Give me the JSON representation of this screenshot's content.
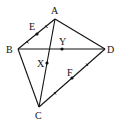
{
  "diagram": {
    "vertices": [
      {
        "id": "A",
        "label": "A",
        "x": 55,
        "y": 19,
        "lx": 51,
        "ly": 14
      },
      {
        "id": "B",
        "label": "B",
        "x": 18,
        "y": 49,
        "lx": 6,
        "ly": 53
      },
      {
        "id": "C",
        "label": "C",
        "x": 39,
        "y": 107,
        "lx": 35,
        "ly": 119
      },
      {
        "id": "D",
        "label": "D",
        "x": 105,
        "y": 49,
        "lx": 107,
        "ly": 53
      }
    ],
    "edges": [
      {
        "from": "A",
        "to": "B"
      },
      {
        "from": "A",
        "to": "D"
      },
      {
        "from": "B",
        "to": "D"
      },
      {
        "from": "B",
        "to": "C"
      },
      {
        "from": "C",
        "to": "D"
      },
      {
        "from": "A",
        "to": "C"
      }
    ],
    "points": [
      {
        "id": "E",
        "label": "E",
        "x": 37,
        "y": 34,
        "lx": 29,
        "ly": 30,
        "on": "AB"
      },
      {
        "id": "Y",
        "label": "Y",
        "x": 62,
        "y": 49,
        "lx": 60,
        "ly": 45,
        "on": "BD"
      },
      {
        "id": "X",
        "label": "X",
        "x": 47,
        "y": 63,
        "lx": 37,
        "ly": 67,
        "on": "AC"
      },
      {
        "id": "F",
        "label": "F",
        "x": 72,
        "y": 78,
        "lx": 67,
        "ly": 76,
        "on": "CD"
      }
    ]
  }
}
